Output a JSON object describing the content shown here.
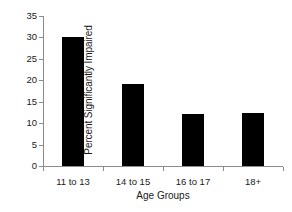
{
  "chart_data": {
    "type": "bar",
    "title": "",
    "categories": [
      "11 to 13",
      "14 to 15",
      "16 to 17",
      "18+"
    ],
    "values": [
      30.2,
      19.1,
      12.2,
      12.3
    ],
    "xlabel": "Age Groups",
    "ylabel": "Percent Significantly Impaired",
    "ylim": [
      0,
      35
    ],
    "ytick_values": [
      0,
      5,
      10,
      15,
      20,
      25,
      30,
      35
    ],
    "ytick_labels": [
      "0",
      "5",
      "10",
      "15",
      "20",
      "25",
      "30",
      "35"
    ],
    "grid": false,
    "legend": null,
    "bar_color": "#000000",
    "axis_color": "#8c8c8c",
    "text_color": "#1a1a1a",
    "background": "#ffffff"
  }
}
